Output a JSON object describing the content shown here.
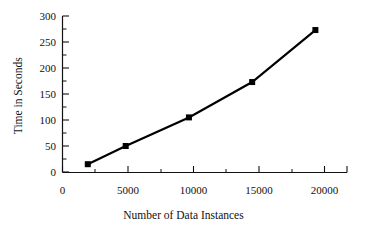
{
  "chart_data": {
    "type": "line",
    "title": "",
    "xlabel": "Number of Data Instances",
    "ylabel": "Time in Seconds",
    "x": [
      2000,
      5000,
      10000,
      15000,
      20000
    ],
    "values": [
      15,
      50,
      105,
      173,
      273
    ],
    "series": [
      {
        "name": "Time in Seconds",
        "x": [
          2000,
          5000,
          10000,
          15000,
          20000
        ],
        "values": [
          15,
          50,
          105,
          173,
          273
        ]
      }
    ],
    "xlim": [
      0,
      22500
    ],
    "ylim": [
      0,
      300
    ],
    "xticks": [
      0,
      5000,
      10000,
      15000,
      20000
    ],
    "xtick_labels": [
      "0",
      "5000",
      "10000",
      "15000",
      "20000"
    ],
    "x_minor_ticks": [
      2500,
      7500,
      12500,
      17500,
      22500
    ],
    "yticks": [
      0,
      50,
      100,
      150,
      200,
      250,
      300
    ],
    "ytick_labels": [
      "0",
      "50",
      "100",
      "150",
      "200",
      "250",
      "300"
    ],
    "y_minor_ticks": [
      25,
      75,
      125,
      175,
      225,
      275
    ],
    "grid": false,
    "legend": false,
    "legend_position": "none",
    "marker": "square",
    "line_color": "#000000",
    "marker_color": "#000000",
    "background_color": "#ffffff"
  }
}
